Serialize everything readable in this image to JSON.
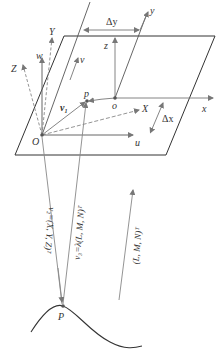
{
  "diagram": {
    "type": "geometry",
    "colors": {
      "line": "#333333",
      "arrow": "#777777",
      "plane": "#333333",
      "dashed": "#888888",
      "background": "#ffffff"
    },
    "labels": {
      "Y": "Y",
      "Z": "Z",
      "w": "w",
      "v": "v",
      "X": "X",
      "u": "u",
      "O": "O",
      "o": "o",
      "p": "p",
      "x": "x",
      "y": "y",
      "z": "z",
      "delta_x": "Δx",
      "delta_y": "Δy",
      "v1": "v",
      "v1_sub": "1",
      "P": "P",
      "v2_eq": "v₂=(X, Y, Z)ᵀ",
      "v3_eq": "v₃=λ(L, M, N)ᵀ",
      "LMN": "(L, M, N)ᵀ"
    }
  }
}
